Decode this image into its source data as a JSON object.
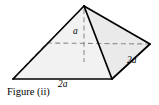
{
  "figure": {
    "caption": "Figure (ii)",
    "shape": "square-pyramid",
    "colors": {
      "stroke": "#000000",
      "face_front_left": "#f2f2f2",
      "face_front_right": "#ebebeb",
      "face_back": "#f7f7f7",
      "dashed": "#888888",
      "background": "#ffffff"
    },
    "labels": {
      "height": {
        "coefficient": "",
        "symbol": "a",
        "text": "a"
      },
      "base_front": {
        "coefficient": "2",
        "symbol": "a",
        "text": "2a"
      },
      "edge_right": {
        "coefficient": "2",
        "symbol": "a",
        "text": "2a"
      }
    },
    "geometry": {
      "apex": [
        84,
        6
      ],
      "base_front_left": [
        13,
        79
      ],
      "base_front_right": [
        112,
        79
      ],
      "base_right": [
        150,
        44
      ],
      "base_back": [
        47,
        43
      ],
      "height_foot": [
        84,
        60
      ]
    }
  }
}
